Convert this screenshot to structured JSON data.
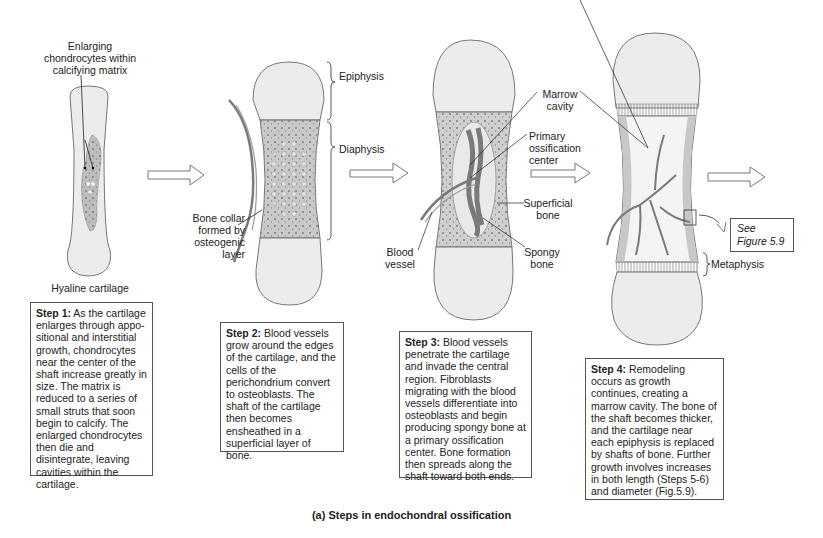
{
  "figure": {
    "caption": "(a) Steps in endochondral ossification",
    "colors": {
      "cartilage_fill": "#ececec",
      "shaft_fill": "#c9c9c9",
      "outline": "#6e6e6e",
      "vessel": "#777777",
      "text": "#222222"
    }
  },
  "stage1": {
    "label_lines": [
      "Enlarging",
      "chondrocytes within",
      "calcifying matrix"
    ],
    "bottom_label": "Hyaline cartilage",
    "step": {
      "title": "Step 1:",
      "text": "As the cartilage enlarges through appo-sitional and interstitial growth, chondrocytes near the center of the shaft increase greatly in size. The matrix is reduced to a series of small struts that soon begin to calcify. The enlarged chondrocytes then die and disintegrate, leaving cavities within the cartilage."
    }
  },
  "stage2": {
    "epiphysis": "Epiphysis",
    "diaphysis": "Diaphysis",
    "bone_collar_lines": [
      "Bone collar",
      "formed by",
      "osteogenic",
      "layer"
    ],
    "step": {
      "title": "Step 2:",
      "text": "Blood vessels grow around the edges of the cartilage, and the cells of the perichondrium convert to osteoblasts. The shaft of the cartilage then becomes ensheathed in a superficial layer of bone."
    }
  },
  "stage3": {
    "marrow_cavity_lines": [
      "Marrow",
      "cavity"
    ],
    "primary_ossification_lines": [
      "Primary",
      "ossification",
      "center"
    ],
    "superficial_bone_lines": [
      "Superficial",
      "bone"
    ],
    "spongy_bone_lines": [
      "Spongy",
      "bone"
    ],
    "blood_vessel_lines": [
      "Blood",
      "vessel"
    ],
    "step": {
      "title": "Step 3:",
      "text": "Blood vessels penetrate the cartilage and invade the central region. Fibroblasts migrating with the blood vessels differentiate into osteoblasts and begin producing spongy bone at a primary ossification center.  Bone formation then spreads  along the shaft toward both ends."
    }
  },
  "stage4": {
    "see_figure_lines": [
      "See",
      "Figure 5.9"
    ],
    "metaphysis": "Metaphysis",
    "step": {
      "title": "Step 4:",
      "text": "Remodeling occurs as growth continues, creating a marrow cavity. The bone of the shaft becomes thicker, and the cartilage near each epiphysis is replaced by shafts of bone. Further growth involves increases in both length (Steps 5-6) and diameter (Fig.5.9)."
    }
  }
}
